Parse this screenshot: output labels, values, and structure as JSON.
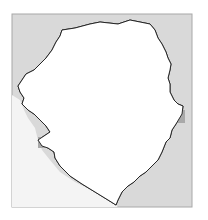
{
  "map": {
    "region": "Sierra Leone",
    "frame": {
      "x": 12,
      "y": 14,
      "width": 180,
      "height": 193
    },
    "colors": {
      "background": "#ffffff",
      "outside_land": "#d9d9d9",
      "country_fill": "#ffffff",
      "frame_stroke": "#a8a8a8",
      "border_stroke": "#1a1a1a",
      "internal_boundary": "#c8c8c8",
      "cell_light": "#c9c9c9",
      "cell_medium": "#a9a9a9"
    },
    "cells": [
      {
        "x": 118,
        "y": 24,
        "w": 13,
        "h": 13,
        "shade": "light"
      },
      {
        "x": 79,
        "y": 30,
        "w": 13,
        "h": 20,
        "shade": "medium"
      },
      {
        "x": 65,
        "y": 52,
        "w": 13,
        "h": 28,
        "shade": "medium"
      },
      {
        "x": 147,
        "y": 51,
        "w": 13,
        "h": 13,
        "shade": "medium"
      },
      {
        "x": 117,
        "y": 66,
        "w": 13,
        "h": 13,
        "shade": "light"
      },
      {
        "x": 103,
        "y": 80,
        "w": 13,
        "h": 13,
        "shade": "medium"
      },
      {
        "x": 160,
        "y": 71,
        "w": 8,
        "h": 16,
        "shade": "light"
      },
      {
        "x": 79,
        "y": 93,
        "w": 26,
        "h": 13,
        "shade": "light"
      },
      {
        "x": 65,
        "y": 103,
        "w": 13,
        "h": 14,
        "shade": "medium"
      },
      {
        "x": 106,
        "y": 122,
        "w": 13,
        "h": 13,
        "shade": "medium"
      },
      {
        "x": 134,
        "y": 136,
        "w": 26,
        "h": 12,
        "shade": "medium"
      },
      {
        "x": 134,
        "y": 148,
        "w": 10,
        "h": 22,
        "shade": "medium"
      },
      {
        "x": 175,
        "y": 110,
        "w": 10,
        "h": 13,
        "shade": "medium"
      },
      {
        "x": 38,
        "y": 137,
        "w": 12,
        "h": 11,
        "shade": "medium"
      },
      {
        "x": 65,
        "y": 151,
        "w": 13,
        "h": 13,
        "shade": "medium"
      },
      {
        "x": 106,
        "y": 180,
        "w": 13,
        "h": 12,
        "shade": "medium"
      }
    ],
    "markers": [
      {
        "x": 107,
        "y": 136,
        "type": "small-circle"
      },
      {
        "x": 137,
        "y": 143,
        "type": "small-circle"
      }
    ]
  }
}
